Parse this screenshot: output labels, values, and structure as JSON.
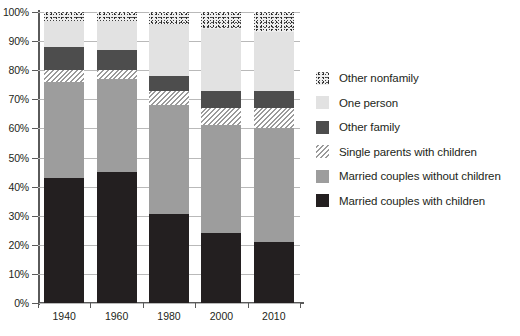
{
  "chart_data": {
    "type": "bar",
    "stacked": true,
    "stack_mode": "percent",
    "title": "",
    "xlabel": "",
    "ylabel": "",
    "categories": [
      "1940",
      "1960",
      "1980",
      "2000",
      "2010"
    ],
    "ylim": [
      0,
      100
    ],
    "ytick_labels": [
      "0%",
      "10%",
      "20%",
      "30%",
      "40%",
      "50%",
      "60%",
      "70%",
      "80%",
      "90%",
      "100%"
    ],
    "ytick_values": [
      0,
      10,
      20,
      30,
      40,
      50,
      60,
      70,
      80,
      90,
      100
    ],
    "grid": true,
    "legend_position": "right",
    "series": [
      {
        "name": "Married couples with children",
        "color": "#231f20",
        "pattern": "solid",
        "values": [
          43,
          45,
          30.5,
          24,
          21
        ]
      },
      {
        "name": "Married couples without children",
        "color": "#9d9d9d",
        "pattern": "solid",
        "values": [
          33,
          32,
          37.5,
          37,
          39
        ]
      },
      {
        "name": "Single parents with children",
        "color": "#d8d8d8",
        "pattern": "diagonal-hatch",
        "values": [
          4,
          3,
          5,
          6,
          7
        ]
      },
      {
        "name": "Other family",
        "color": "#4d4d4d",
        "pattern": "solid",
        "values": [
          8,
          7,
          5,
          6,
          6
        ]
      },
      {
        "name": "One person",
        "color": "#e2e2e2",
        "pattern": "solid",
        "values": [
          9,
          10,
          18,
          21,
          20
        ]
      },
      {
        "name": "Other nonfamily",
        "color": "#ededed",
        "pattern": "speckle",
        "values": [
          3,
          3,
          4,
          6,
          7
        ]
      }
    ]
  },
  "legend": {
    "items": [
      {
        "label": "Other nonfamily",
        "swatch": "fill-nonfam"
      },
      {
        "label": "One person",
        "swatch": "fill-oneperson"
      },
      {
        "label": "Other family",
        "swatch": "fill-otherfam"
      },
      {
        "label": "Single parents with children",
        "swatch": "fill-single"
      },
      {
        "label": "Married couples without children",
        "swatch": "fill-mcwithout"
      },
      {
        "label": "Married couples with children",
        "swatch": "fill-mcwith"
      }
    ]
  }
}
